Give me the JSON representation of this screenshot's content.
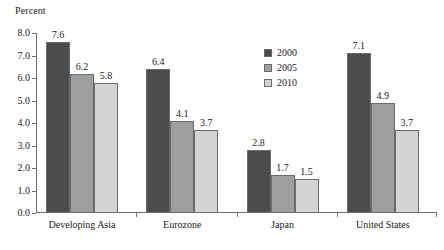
{
  "chart_data": {
    "type": "bar",
    "title": "",
    "subtitle": "",
    "xlabel": "",
    "ylabel": "Percent",
    "ylim": [
      0.0,
      8.0
    ],
    "ytick_labels": [
      "0.0",
      "1.0",
      "2.0",
      "3.0",
      "4.0",
      "5.0",
      "6.0",
      "7.0",
      "8.0"
    ],
    "ytick_values": [
      0.0,
      1.0,
      2.0,
      3.0,
      4.0,
      5.0,
      6.0,
      7.0,
      8.0
    ],
    "grid": false,
    "legend_position": "inside-upper-center",
    "categories": [
      "Developing Asia",
      "Eurozone",
      "Japan",
      "United States"
    ],
    "series": [
      {
        "name": "2000",
        "color": "#4c4c4c",
        "values": [
          7.6,
          6.4,
          2.8,
          7.1
        ],
        "labels": [
          "7.6",
          "6.4",
          "2.8",
          "7.1"
        ]
      },
      {
        "name": "2005",
        "color": "#9e9e9e",
        "values": [
          6.2,
          4.1,
          1.7,
          4.9
        ],
        "labels": [
          "6.2",
          "4.1",
          "1.7",
          "4.9"
        ]
      },
      {
        "name": "2010",
        "color": "#d4d4d4",
        "values": [
          5.8,
          3.7,
          1.5,
          3.7
        ],
        "labels": [
          "5.8",
          "3.7",
          "1.5",
          "3.7"
        ]
      }
    ],
    "annotations": []
  },
  "legend": {
    "items": [
      {
        "label": "2000",
        "swatch": "legend-swatch-2000"
      },
      {
        "label": "2005",
        "swatch": "legend-swatch-2005"
      },
      {
        "label": "2010",
        "swatch": "legend-swatch-2010"
      }
    ]
  },
  "colors": {
    "axis": "#6f6f6f",
    "bar_outline": "#6a6a6a",
    "text": "#1a1a1a",
    "background": "#ffffff"
  }
}
